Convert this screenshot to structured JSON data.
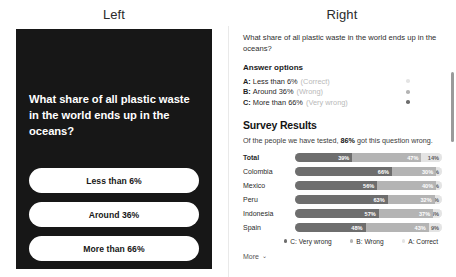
{
  "headings": {
    "left": "Left",
    "right": "Right"
  },
  "phone": {
    "question": "What share of all plastic waste in the world ends up in the oceans?",
    "choices": [
      {
        "label": "Less than 6%"
      },
      {
        "label": "Around 36%"
      },
      {
        "label": "More than 66%"
      }
    ]
  },
  "card": {
    "question": "What share of all plastic waste in the world ends up in the oceans?",
    "answer_options_title": "Answer options",
    "options": [
      {
        "letter": "A:",
        "label": "Less than 6%",
        "tag": "(Correct)",
        "dot_color": "#e4e4e4"
      },
      {
        "letter": "B:",
        "label": "Around 36%",
        "tag": "(Wrong)",
        "dot_color": "#b4b4b4"
      },
      {
        "letter": "C:",
        "label": "More than 66%",
        "tag": "(Very wrong)",
        "dot_color": "#6e6e6e"
      }
    ],
    "results_title": "Survey Results",
    "results_sub_before": "Of the people we have tested, ",
    "results_sub_strong": "86%",
    "results_sub_after": " got this question wrong.",
    "legend": [
      {
        "label": "C: Very wrong",
        "color": "#6e6e6e"
      },
      {
        "label": "B: Wrong",
        "color": "#b4b4b4"
      },
      {
        "label": "A: Correct",
        "color": "#e4e4e4"
      }
    ],
    "more_label": "More",
    "more_chevron": "⌄"
  },
  "chart_data": {
    "type": "bar",
    "title": "Survey Results",
    "subtitle": "Of the people we have tested, 86% got this question wrong.",
    "orientation": "horizontal",
    "stacked": true,
    "xlabel": "",
    "ylabel": "",
    "xlim": [
      0,
      100
    ],
    "grid": false,
    "legend_position": "bottom-right",
    "categories": [
      "Total",
      "Colombia",
      "Mexico",
      "Peru",
      "Indonesia",
      "Spain"
    ],
    "series": [
      {
        "name": "C: Very wrong",
        "color": "#6e6e6e",
        "values": [
          39,
          66,
          56,
          63,
          57,
          48
        ]
      },
      {
        "name": "B: Wrong",
        "color": "#b4b4b4",
        "values": [
          47,
          30,
          40,
          32,
          37,
          43
        ]
      },
      {
        "name": "A: Correct",
        "color": "#e4e4e4",
        "values": [
          14,
          4,
          4,
          5,
          6,
          9
        ]
      }
    ],
    "rows": [
      {
        "category": "Total",
        "segments": [
          {
            "series": "C: Very wrong",
            "value": 39,
            "label": "39%"
          },
          {
            "series": "B: Wrong",
            "value": 47,
            "label": "47%"
          },
          {
            "series": "A: Correct",
            "value": 14,
            "label": "14%"
          }
        ]
      },
      {
        "category": "Colombia",
        "segments": [
          {
            "series": "C: Very wrong",
            "value": 66,
            "label": "66%"
          },
          {
            "series": "B: Wrong",
            "value": 30,
            "label": "30%"
          },
          {
            "series": "A: Correct",
            "value": 4,
            "label": "4%"
          }
        ]
      },
      {
        "category": "Mexico",
        "segments": [
          {
            "series": "C: Very wrong",
            "value": 56,
            "label": "56%"
          },
          {
            "series": "B: Wrong",
            "value": 40,
            "label": "40%"
          },
          {
            "series": "A: Correct",
            "value": 4,
            "label": "4%"
          }
        ]
      },
      {
        "category": "Peru",
        "segments": [
          {
            "series": "C: Very wrong",
            "value": 63,
            "label": "63%"
          },
          {
            "series": "B: Wrong",
            "value": 32,
            "label": "32%"
          },
          {
            "series": "A: Correct",
            "value": 5,
            "label": "5%"
          }
        ]
      },
      {
        "category": "Indonesia",
        "segments": [
          {
            "series": "C: Very wrong",
            "value": 57,
            "label": "57%"
          },
          {
            "series": "B: Wrong",
            "value": 37,
            "label": "37%"
          },
          {
            "series": "A: Correct",
            "value": 6,
            "label": "6%"
          }
        ]
      },
      {
        "category": "Spain",
        "segments": [
          {
            "series": "C: Very wrong",
            "value": 48,
            "label": "48%"
          },
          {
            "series": "B: Wrong",
            "value": 43,
            "label": "43%"
          },
          {
            "series": "A: Correct",
            "value": 9,
            "label": "9%"
          }
        ]
      }
    ]
  }
}
